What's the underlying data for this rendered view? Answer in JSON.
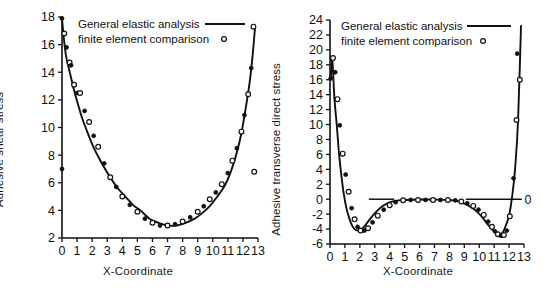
{
  "figure": {
    "background": "#ffffff",
    "foreground": "#111111",
    "panels": 2
  },
  "chart_data": [
    {
      "id": "adhesive-shear-stress",
      "type": "line",
      "title": "",
      "xlabel": "X-Coordinate",
      "ylabel": "Adhesive shear stress",
      "xlim": [
        0,
        13
      ],
      "ylim": [
        2,
        18
      ],
      "xticks": [
        0,
        1,
        2,
        3,
        4,
        5,
        6,
        7,
        8,
        9,
        10,
        11,
        12,
        13
      ],
      "xticklabels": [
        "0",
        "1",
        "2",
        "3",
        "4",
        "5",
        "6",
        "7",
        "8",
        "9",
        "10",
        "11",
        "12",
        "13"
      ],
      "yticks": [
        2,
        4,
        6,
        8,
        10,
        12,
        14,
        16,
        18
      ],
      "yticklabels": [
        "2",
        "4",
        "6",
        "8",
        "10",
        "12",
        "14",
        "16",
        "18"
      ],
      "grid": false,
      "legend_position": "top-right-inside",
      "legend": [
        {
          "label": "General elastic analysis",
          "marker": "line"
        },
        {
          "label": "finite element comparison",
          "marker": "open-circle"
        }
      ],
      "series": [
        {
          "name": "General elastic analysis",
          "style": "line",
          "x": [
            0.0,
            0.1,
            0.2,
            0.3,
            0.45,
            0.6,
            0.8,
            1.0,
            1.3,
            1.6,
            2.0,
            2.4,
            2.8,
            3.2,
            3.7,
            4.2,
            4.7,
            5.2,
            5.8,
            6.4,
            7.0,
            7.6,
            8.2,
            8.8,
            9.3,
            9.8,
            10.3,
            10.8,
            11.2,
            11.6,
            11.9,
            12.2,
            12.45,
            12.65,
            12.8
          ],
          "y": [
            17.9,
            16.7,
            15.7,
            15.0,
            14.3,
            13.6,
            12.7,
            11.9,
            10.8,
            9.9,
            8.8,
            7.9,
            7.1,
            6.4,
            5.6,
            5.0,
            4.4,
            4.0,
            3.4,
            3.1,
            2.9,
            2.9,
            3.1,
            3.4,
            3.8,
            4.3,
            5.0,
            5.8,
            6.8,
            8.2,
            9.6,
            11.5,
            13.3,
            15.3,
            17.2
          ]
        },
        {
          "name": "finite element comparison",
          "style": "markers",
          "x": [
            0.0,
            0.15,
            0.3,
            0.5,
            0.6,
            0.8,
            1.0,
            1.2,
            1.5,
            1.8,
            2.1,
            2.4,
            2.8,
            3.2,
            3.6,
            4.0,
            4.5,
            5.0,
            5.5,
            6.0,
            6.5,
            7.0,
            7.5,
            8.0,
            8.5,
            9.0,
            9.4,
            9.8,
            10.2,
            10.6,
            11.0,
            11.3,
            11.6,
            11.9,
            12.1,
            12.35,
            12.55,
            12.7
          ],
          "y": [
            17.9,
            16.8,
            15.8,
            14.7,
            14.5,
            13.1,
            12.5,
            12.5,
            11.2,
            10.4,
            9.4,
            8.6,
            7.4,
            6.4,
            5.7,
            5.0,
            4.4,
            3.9,
            3.4,
            3.1,
            2.9,
            2.9,
            3.0,
            3.2,
            3.5,
            3.9,
            4.3,
            4.8,
            5.3,
            5.9,
            6.7,
            7.6,
            8.5,
            9.7,
            10.9,
            12.4,
            14.3,
            17.3
          ]
        },
        {
          "name": "outliers",
          "style": "markers",
          "x": [
            0.0,
            12.75
          ],
          "y": [
            7.0,
            6.8
          ]
        }
      ]
    },
    {
      "id": "adhesive-transverse-direct-stress",
      "type": "line",
      "title": "",
      "xlabel": "X-Coordinate",
      "ylabel": "Adhesive transverse direct stress",
      "xlim": [
        0,
        13
      ],
      "ylim": [
        -6,
        24
      ],
      "xticks": [
        0,
        1,
        2,
        3,
        4,
        5,
        6,
        7,
        8,
        9,
        10,
        11,
        12,
        13
      ],
      "xticklabels": [
        "0",
        "1",
        "2",
        "3",
        "4",
        "5",
        "6",
        "7",
        "8",
        "9",
        "10",
        "11",
        "12",
        "13"
      ],
      "yticks": [
        -6,
        -4,
        -2,
        0,
        2,
        4,
        6,
        8,
        10,
        12,
        14,
        16,
        18,
        20,
        22,
        24
      ],
      "yticklabels": [
        "-6",
        "-4",
        "-2",
        "0",
        "2",
        "4",
        "6",
        "8",
        "10",
        "12",
        "14",
        "16",
        "18",
        "20",
        "22",
        "24"
      ],
      "grid": false,
      "legend_position": "top-right-inside",
      "legend": [
        {
          "label": "General elastic analysis",
          "marker": "line"
        },
        {
          "label": "finite element comparison",
          "marker": "open-circle"
        }
      ],
      "annotations": [
        {
          "text": "0",
          "x": 13.3,
          "y": 0,
          "type": "zero-reference-label"
        }
      ],
      "series": [
        {
          "name": "General elastic analysis",
          "style": "line",
          "x": [
            0.05,
            0.15,
            0.3,
            0.45,
            0.6,
            0.75,
            0.9,
            1.1,
            1.3,
            1.5,
            1.7,
            1.9,
            2.1,
            2.4,
            2.7,
            3.0,
            3.4,
            3.8,
            4.2,
            4.6,
            5.0,
            6.0,
            7.0,
            8.0,
            8.6,
            9.0,
            9.4,
            9.8,
            10.2,
            10.5,
            10.8,
            11.0,
            11.2,
            11.4,
            11.6,
            11.8,
            12.0,
            12.2,
            12.4,
            12.6,
            12.8
          ],
          "y": [
            16.0,
            18.7,
            13.4,
            10.0,
            6.2,
            3.4,
            1.0,
            -1.2,
            -2.6,
            -3.6,
            -4.1,
            -4.2,
            -4.1,
            -3.4,
            -2.6,
            -1.9,
            -1.1,
            -0.6,
            -0.3,
            -0.15,
            -0.1,
            -0.05,
            -0.05,
            -0.1,
            -0.3,
            -0.6,
            -1.0,
            -1.6,
            -2.4,
            -3.2,
            -3.9,
            -4.3,
            -4.6,
            -4.7,
            -4.4,
            -3.4,
            -2.2,
            0.3,
            4.0,
            10.5,
            23.2
          ]
        },
        {
          "name": "finite element comparison",
          "style": "markers",
          "x": [
            0.05,
            0.2,
            0.35,
            0.5,
            0.65,
            0.85,
            1.05,
            1.25,
            1.45,
            1.65,
            1.85,
            2.05,
            2.3,
            2.55,
            2.85,
            3.2,
            3.6,
            4.0,
            4.4,
            4.9,
            5.4,
            5.9,
            6.4,
            6.9,
            7.4,
            7.9,
            8.4,
            8.8,
            9.2,
            9.6,
            9.95,
            10.3,
            10.6,
            10.85,
            11.05,
            11.25,
            11.45,
            11.65,
            11.85,
            12.05,
            12.3,
            12.5,
            12.7
          ],
          "y": [
            16.2,
            18.9,
            17.0,
            13.4,
            9.9,
            6.1,
            3.3,
            1.0,
            -1.2,
            -2.7,
            -3.7,
            -4.2,
            -4.2,
            -3.9,
            -3.1,
            -2.2,
            -1.4,
            -0.8,
            -0.4,
            -0.15,
            -0.1,
            -0.1,
            -0.1,
            -0.1,
            -0.1,
            -0.1,
            -0.15,
            -0.3,
            -0.55,
            -0.9,
            -1.4,
            -2.1,
            -3.0,
            -3.7,
            -4.3,
            -4.7,
            -4.9,
            -4.8,
            -4.2,
            -2.3,
            2.8,
            10.6,
            16.0
          ]
        },
        {
          "name": "upper-right-markers",
          "style": "markers",
          "x": [
            12.55,
            12.72
          ],
          "y": [
            19.5,
            16.0
          ]
        }
      ]
    }
  ]
}
